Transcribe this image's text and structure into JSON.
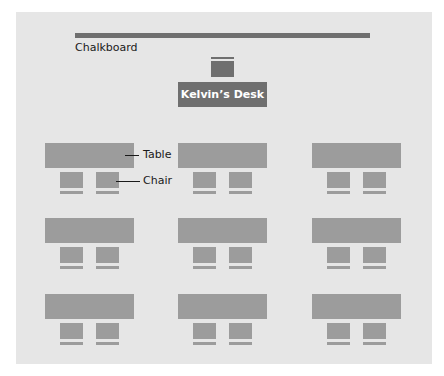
{
  "diagram": {
    "chalkboard_label": "Chalkboard",
    "desk_label": "Kelvin’s Desk",
    "table_label": "Table",
    "chair_label": "Chair"
  },
  "layout": {
    "rows": 3,
    "columns": 3,
    "chairs_per_table": 2
  },
  "colors": {
    "background": "#e6e6e6",
    "dark": "#6f6f6f",
    "furniture": "#9c9c9c"
  }
}
